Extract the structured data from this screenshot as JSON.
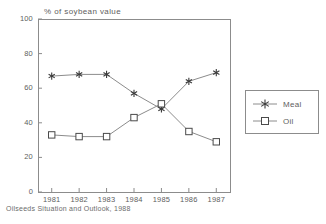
{
  "chart_data": {
    "type": "line",
    "title": "% of soybean value",
    "xlabel": "",
    "ylabel": "% of soybean value",
    "x": [
      "1981",
      "1982",
      "1983",
      "1984",
      "1985",
      "1986",
      "1987"
    ],
    "categories": [
      "1981",
      "1982",
      "1983",
      "1984",
      "1985",
      "1986",
      "1987"
    ],
    "series": [
      {
        "name": "Meal",
        "marker": "asterisk",
        "values": [
          67,
          68,
          68,
          57,
          48,
          64,
          69
        ]
      },
      {
        "name": "Oil",
        "marker": "open-square",
        "values": [
          33,
          32,
          32,
          43,
          51,
          35,
          29
        ]
      }
    ],
    "ylim": [
      0,
      100
    ],
    "yticks": [
      0,
      20,
      40,
      60,
      80,
      100
    ],
    "grid": false,
    "legend_position": "right-outside",
    "legend_entries": [
      "Meal",
      "Oil"
    ],
    "footnote": "Oilseeds Situation and Outlook, 1988",
    "line_color": "#8c8c8c",
    "frame_color": "#8c8c8c",
    "text_color": "#5e5e5e"
  },
  "layout": {
    "plot_left": 38,
    "plot_right": 230,
    "plot_top": 19,
    "plot_bottom": 192
  }
}
